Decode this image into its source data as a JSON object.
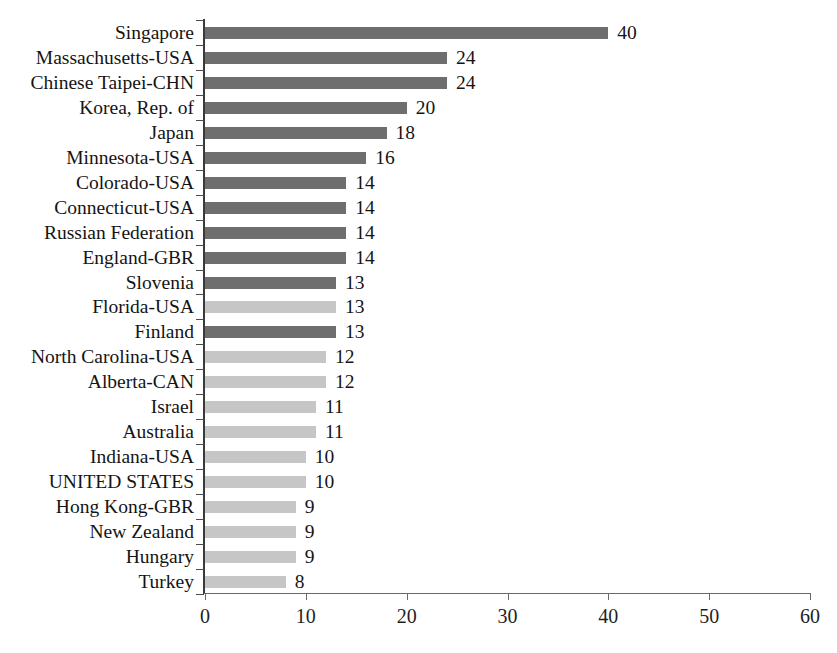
{
  "chart_data": {
    "type": "bar",
    "orientation": "horizontal",
    "title": "",
    "subtitle": "",
    "xlabel": "",
    "ylabel": "",
    "xlim": [
      0,
      60
    ],
    "xticks": [
      0,
      10,
      20,
      30,
      40,
      50,
      60
    ],
    "xtick_labels": [
      "0",
      "10",
      "20",
      "30",
      "40",
      "50",
      "60"
    ],
    "grid": false,
    "legend": "none",
    "categories": [
      "Singapore",
      "Massachusetts-USA",
      "Chinese Taipei-CHN",
      "Korea, Rep. of",
      "Japan",
      "Minnesota-USA",
      "Colorado-USA",
      "Connecticut-USA",
      "Russian Federation",
      "England-GBR",
      "Slovenia",
      "Florida-USA",
      "Finland",
      "North Carolina-USA",
      "Alberta-CAN",
      "Israel",
      "Australia",
      "Indiana-USA",
      "UNITED STATES",
      "Hong Kong-GBR",
      "New Zealand",
      "Hungary",
      "Turkey"
    ],
    "values": [
      40,
      24,
      24,
      20,
      18,
      16,
      14,
      14,
      14,
      14,
      13,
      13,
      13,
      12,
      12,
      11,
      11,
      10,
      10,
      9,
      9,
      9,
      8
    ],
    "value_labels": [
      "40",
      "24",
      "24",
      "20",
      "18",
      "16",
      "14",
      "14",
      "14",
      "14",
      "13",
      "13",
      "13",
      "12",
      "12",
      "11",
      "11",
      "10",
      "10",
      "9",
      "9",
      "9",
      "8"
    ],
    "bar_shades": [
      "dark",
      "dark",
      "dark",
      "dark",
      "dark",
      "dark",
      "dark",
      "dark",
      "dark",
      "dark",
      "dark",
      "light",
      "dark",
      "light",
      "light",
      "light",
      "light",
      "light",
      "light",
      "light",
      "light",
      "light",
      "light"
    ],
    "colors": {
      "dark_bar": "#6e6e6e",
      "light_bar": "#c6c6c6",
      "axis": "#3a3a3a",
      "text": "#141414",
      "background": "#ffffff"
    }
  }
}
